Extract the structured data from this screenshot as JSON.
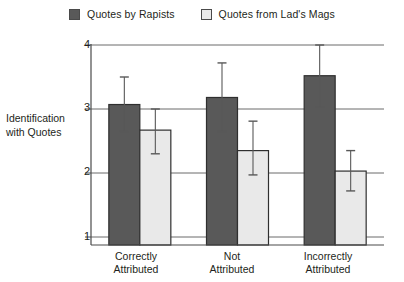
{
  "chart_data": {
    "type": "bar",
    "title": "",
    "subtitle": "",
    "xlabel": "",
    "ylabel": "Identification with Quotes",
    "ylabel_lines": [
      "Identification",
      "with",
      "Quotes"
    ],
    "categories": [
      "Correctly Attributed",
      "Not Attributed",
      "Incorrectly Attributed"
    ],
    "category_lines": [
      [
        "Correctly",
        "Attributed"
      ],
      [
        "Not",
        "Attributed"
      ],
      [
        "Incorrectly",
        "Attributed"
      ]
    ],
    "ylim": [
      1,
      4
    ],
    "yticks": [
      1,
      2,
      3,
      4
    ],
    "ytick_labels": [
      "1",
      "2",
      "3",
      "4"
    ],
    "grid": true,
    "grid_axis": "y",
    "legend_position": "top-center",
    "baseline": 1,
    "series": [
      {
        "name": "Quotes by Rapists",
        "color": "#595959",
        "border_color": "#2f2f2f",
        "values": [
          3.07,
          3.18,
          3.52
        ],
        "errors_upper": [
          0.43,
          0.54,
          0.48
        ],
        "errors_lower": [
          0.42,
          0.53,
          0.49
        ],
        "error_top": [
          3.5,
          3.72,
          4.0
        ],
        "error_bottom": [
          2.65,
          2.65,
          3.03
        ]
      },
      {
        "name": "Quotes from Lad's Mags",
        "color": "#e9e9e9",
        "border_color": "#2f2f2f",
        "values": [
          2.67,
          2.35,
          2.03
        ],
        "errors_upper": [
          0.33,
          0.46,
          0.32
        ],
        "errors_lower": [
          0.37,
          0.38,
          0.31
        ],
        "error_top": [
          3.0,
          2.81,
          2.35
        ],
        "error_bottom": [
          2.3,
          1.97,
          1.72
        ]
      }
    ]
  },
  "legend": {
    "items": [
      {
        "label": "Quotes by Rapists",
        "color": "#595959"
      },
      {
        "label": "Quotes from Lad's Mags",
        "color": "#e9e9e9"
      }
    ]
  },
  "axis": {
    "y_caption_line1": "Identification",
    "y_caption_line2": "with",
    "y_caption_line3": "Quotes",
    "y_tick_4": "4",
    "y_tick_3": "3",
    "y_tick_2": "2",
    "y_tick_1": "1"
  },
  "x_labels": {
    "cat0_line1": "Correctly",
    "cat0_line2": "Attributed",
    "cat1_line1": "Not",
    "cat1_line2": "Attributed",
    "cat2_line1": "Incorrectly",
    "cat2_line2": "Attributed"
  },
  "colors": {
    "series1": "#595959",
    "series2": "#e9e9e9",
    "axis": "#4a4a4a",
    "grid": "#6b6b6b",
    "text": "#231f20"
  }
}
